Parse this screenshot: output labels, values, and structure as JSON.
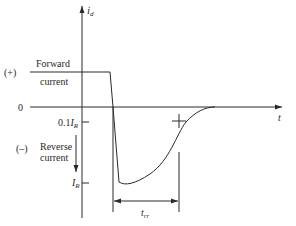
{
  "diagram": {
    "y_axis_label": "i",
    "y_axis_label_sub": "d",
    "x_axis_label": "t",
    "forward": {
      "sign": "(+)",
      "label_line1": "Forward",
      "label_line2": "current"
    },
    "zero_label": "0",
    "tenth_label": "0.1",
    "tenth_label_var": "I",
    "tenth_label_sub": "R",
    "reverse": {
      "sign": "(–)",
      "label_line1": "Reverse",
      "label_line2": "current"
    },
    "peak_label": "I",
    "peak_label_sub": "R",
    "trr_label": "t",
    "trr_label_sub": "rr",
    "colors": {
      "line": "#2a2a2a",
      "background": "#ffffff"
    }
  }
}
